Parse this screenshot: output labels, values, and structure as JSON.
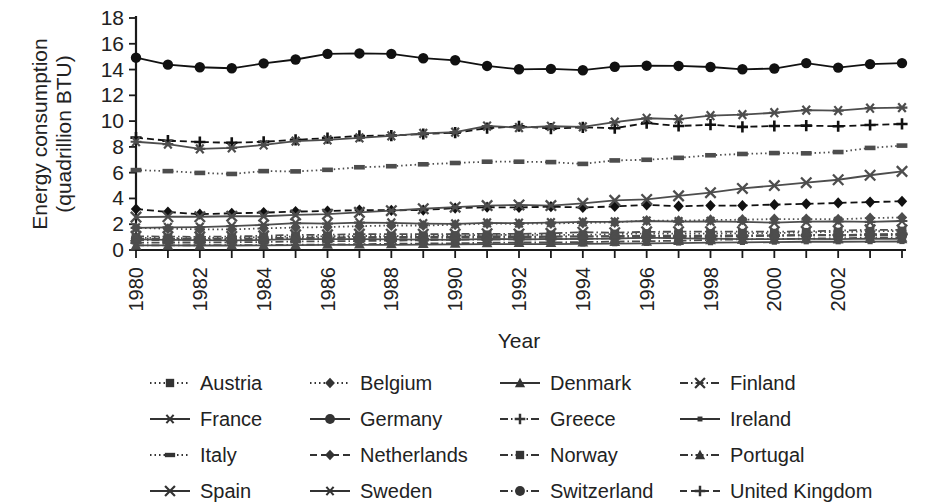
{
  "chart_data": {
    "type": "line",
    "title": "",
    "xlabel": "Year",
    "ylabel": "Energy consumption (quadrillion BTU)",
    "ylabel_line1": "Energy consumption",
    "ylabel_line2": "(quadrillion BTU)",
    "grid": false,
    "legend_position": "bottom",
    "xlim": [
      1980,
      2004
    ],
    "ylim": [
      0,
      18
    ],
    "yticks": [
      0,
      2,
      4,
      6,
      8,
      10,
      12,
      14,
      16,
      18
    ],
    "ytick_labels": [
      "0",
      "2",
      "4",
      "6",
      "8",
      "10",
      "12",
      "14",
      "16",
      "18"
    ],
    "xticks": [
      1980,
      1981,
      1982,
      1983,
      1984,
      1985,
      1986,
      1987,
      1988,
      1989,
      1990,
      1991,
      1992,
      1993,
      1994,
      1995,
      1996,
      1997,
      1998,
      1999,
      2000,
      2001,
      2002,
      2003,
      2004
    ],
    "xtick_labels_shown": [
      "1980",
      "1982",
      "1984",
      "1986",
      "1988",
      "1990",
      "1992",
      "1994",
      "1996",
      "1998",
      "2000",
      "2002"
    ],
    "x": [
      1980,
      1981,
      1982,
      1983,
      1984,
      1985,
      1986,
      1987,
      1988,
      1989,
      1990,
      1991,
      1992,
      1993,
      1994,
      1995,
      1996,
      1997,
      1998,
      1999,
      2000,
      2001,
      2002,
      2003,
      2004
    ],
    "series": [
      {
        "name": "Austria",
        "marker": "square",
        "dash": "dotted",
        "color": "#4d4d4d",
        "values": [
          0.95,
          0.93,
          0.92,
          0.95,
          1.0,
          1.05,
          1.06,
          1.09,
          1.08,
          1.1,
          1.12,
          1.18,
          1.16,
          1.17,
          1.17,
          1.24,
          1.28,
          1.27,
          1.28,
          1.3,
          1.31,
          1.37,
          1.39,
          1.45,
          1.47
        ]
      },
      {
        "name": "Belgium",
        "marker": "diamond",
        "dash": "dotted",
        "color": "#4d4d4d",
        "values": [
          1.72,
          1.65,
          1.6,
          1.6,
          1.68,
          1.74,
          1.78,
          1.85,
          1.9,
          1.9,
          1.96,
          2.05,
          2.03,
          2.06,
          2.1,
          2.15,
          2.29,
          2.27,
          2.33,
          2.35,
          2.4,
          2.4,
          2.38,
          2.48,
          2.52
        ]
      },
      {
        "name": "Denmark",
        "marker": "triangle",
        "dash": "solid",
        "color": "#4d4d4d",
        "values": [
          0.82,
          0.78,
          0.76,
          0.75,
          0.78,
          0.84,
          0.84,
          0.85,
          0.82,
          0.8,
          0.78,
          0.86,
          0.83,
          0.84,
          0.86,
          0.88,
          0.96,
          0.9,
          0.88,
          0.85,
          0.84,
          0.86,
          0.85,
          0.89,
          0.87
        ]
      },
      {
        "name": "Finland",
        "marker": "x",
        "dash": "dashdot",
        "color": "#4d4d4d",
        "values": [
          1.06,
          1.04,
          1.02,
          1.05,
          1.1,
          1.18,
          1.18,
          1.24,
          1.23,
          1.23,
          1.24,
          1.26,
          1.25,
          1.29,
          1.38,
          1.34,
          1.41,
          1.42,
          1.42,
          1.42,
          1.42,
          1.45,
          1.5,
          1.57,
          1.56
        ]
      },
      {
        "name": "France",
        "marker": "asterisk",
        "dash": "solid",
        "color": "#4d4d4d",
        "values": [
          8.4,
          8.22,
          7.85,
          7.92,
          8.15,
          8.45,
          8.55,
          8.7,
          8.85,
          9.05,
          9.15,
          9.62,
          9.5,
          9.6,
          9.55,
          9.92,
          10.22,
          10.15,
          10.42,
          10.5,
          10.65,
          10.85,
          10.82,
          11.0,
          11.05
        ]
      },
      {
        "name": "Germany",
        "marker": "circle",
        "dash": "solid",
        "color": "#111111",
        "values": [
          14.92,
          14.38,
          14.18,
          14.1,
          14.48,
          14.78,
          15.22,
          15.25,
          15.22,
          14.88,
          14.72,
          14.28,
          14.02,
          14.05,
          13.95,
          14.22,
          14.3,
          14.28,
          14.2,
          14.02,
          14.08,
          14.5,
          14.15,
          14.42,
          14.5
        ]
      },
      {
        "name": "Greece",
        "marker": "plus",
        "dash": "dashdot",
        "color": "#4d4d4d",
        "values": [
          0.56,
          0.58,
          0.58,
          0.6,
          0.62,
          0.66,
          0.68,
          0.7,
          0.73,
          0.76,
          0.8,
          0.8,
          0.83,
          0.84,
          0.87,
          0.9,
          0.95,
          0.98,
          1.04,
          1.06,
          1.12,
          1.14,
          1.16,
          1.22,
          1.25
        ]
      },
      {
        "name": "Ireland",
        "marker": "small-square",
        "dash": "solid",
        "color": "#4d4d4d",
        "values": [
          0.36,
          0.36,
          0.35,
          0.35,
          0.36,
          0.38,
          0.39,
          0.39,
          0.4,
          0.42,
          0.43,
          0.45,
          0.45,
          0.46,
          0.47,
          0.49,
          0.52,
          0.54,
          0.57,
          0.59,
          0.61,
          0.64,
          0.64,
          0.65,
          0.66
        ]
      },
      {
        "name": "Italy",
        "marker": "dash-rect",
        "dash": "dotted",
        "color": "#4d4d4d",
        "values": [
          6.2,
          6.12,
          5.98,
          5.9,
          6.12,
          6.1,
          6.22,
          6.42,
          6.5,
          6.65,
          6.75,
          6.85,
          6.85,
          6.82,
          6.68,
          6.95,
          7.0,
          7.15,
          7.35,
          7.45,
          7.52,
          7.5,
          7.6,
          7.92,
          8.1
        ]
      },
      {
        "name": "Netherlands",
        "marker": "diamond",
        "dash": "dashed",
        "color": "#111111",
        "values": [
          3.18,
          2.95,
          2.78,
          2.85,
          2.9,
          2.98,
          3.02,
          3.1,
          3.08,
          3.1,
          3.25,
          3.32,
          3.3,
          3.36,
          3.3,
          3.38,
          3.5,
          3.4,
          3.45,
          3.45,
          3.52,
          3.58,
          3.65,
          3.72,
          3.78
        ]
      },
      {
        "name": "Norway",
        "marker": "square",
        "dash": "dashdot",
        "color": "#4d4d4d",
        "values": [
          0.77,
          0.78,
          0.78,
          0.8,
          0.85,
          0.92,
          0.92,
          0.95,
          0.95,
          0.95,
          0.95,
          0.98,
          0.98,
          1.02,
          1.05,
          1.08,
          1.12,
          1.12,
          1.12,
          1.15,
          1.12,
          1.17,
          1.15,
          1.18,
          1.22
        ]
      },
      {
        "name": "Portugal",
        "marker": "triangle",
        "dash": "dashdot",
        "color": "#4d4d4d",
        "values": [
          0.36,
          0.36,
          0.37,
          0.38,
          0.38,
          0.4,
          0.43,
          0.45,
          0.48,
          0.5,
          0.52,
          0.56,
          0.58,
          0.58,
          0.62,
          0.65,
          0.68,
          0.72,
          0.78,
          0.83,
          0.85,
          0.88,
          0.92,
          0.94,
          0.98
        ]
      },
      {
        "name": "Spain",
        "marker": "x",
        "dash": "solid",
        "color": "#4d4d4d",
        "values": [
          2.55,
          2.58,
          2.58,
          2.62,
          2.62,
          2.72,
          2.78,
          2.92,
          3.05,
          3.2,
          3.32,
          3.45,
          3.5,
          3.45,
          3.62,
          3.85,
          3.92,
          4.2,
          4.45,
          4.78,
          5.0,
          5.22,
          5.45,
          5.8,
          6.1
        ]
      },
      {
        "name": "Sweden",
        "marker": "asterisk",
        "dash": "solid",
        "color": "#4d4d4d",
        "values": [
          1.72,
          1.75,
          1.78,
          1.85,
          1.95,
          2.08,
          2.05,
          2.12,
          2.1,
          2.05,
          2.02,
          2.1,
          2.08,
          2.12,
          2.18,
          2.18,
          2.25,
          2.2,
          2.22,
          2.18,
          2.12,
          2.2,
          2.22,
          2.18,
          2.25
        ]
      },
      {
        "name": "Switzerland",
        "marker": "circle",
        "dash": "dashdot",
        "color": "#4d4d4d",
        "values": [
          0.88,
          0.86,
          0.86,
          0.88,
          0.92,
          0.96,
          0.98,
          1.0,
          1.02,
          1.02,
          1.05,
          1.08,
          1.06,
          1.06,
          1.05,
          1.06,
          1.08,
          1.08,
          1.1,
          1.1,
          1.12,
          1.14,
          1.12,
          1.14,
          1.15
        ]
      },
      {
        "name": "United Kingdom",
        "marker": "plus",
        "dash": "dashed",
        "color": "#111111",
        "values": [
          8.72,
          8.48,
          8.38,
          8.32,
          8.4,
          8.55,
          8.68,
          8.85,
          8.88,
          9.0,
          9.1,
          9.45,
          9.6,
          9.42,
          9.52,
          9.45,
          9.85,
          9.62,
          9.72,
          9.55,
          9.62,
          9.65,
          9.6,
          9.7,
          9.78
        ]
      }
    ],
    "legend": [
      {
        "label": "Austria",
        "marker": "square",
        "dash": "dotted"
      },
      {
        "label": "Belgium",
        "marker": "diamond",
        "dash": "dotted"
      },
      {
        "label": "Denmark",
        "marker": "triangle",
        "dash": "solid"
      },
      {
        "label": "Finland",
        "marker": "x",
        "dash": "dashdot"
      },
      {
        "label": "France",
        "marker": "asterisk",
        "dash": "solid"
      },
      {
        "label": "Germany",
        "marker": "circle",
        "dash": "solid"
      },
      {
        "label": "Greece",
        "marker": "plus",
        "dash": "dashdot"
      },
      {
        "label": "Ireland",
        "marker": "small-square",
        "dash": "solid"
      },
      {
        "label": "Italy",
        "marker": "dash-rect",
        "dash": "dotted"
      },
      {
        "label": "Netherlands",
        "marker": "diamond",
        "dash": "dashed"
      },
      {
        "label": "Norway",
        "marker": "square",
        "dash": "dashdot"
      },
      {
        "label": "Portugal",
        "marker": "triangle",
        "dash": "dashdot"
      },
      {
        "label": "Spain",
        "marker": "x",
        "dash": "solid"
      },
      {
        "label": "Sweden",
        "marker": "asterisk",
        "dash": "solid"
      },
      {
        "label": "Switzerland",
        "marker": "circle",
        "dash": "dashdot"
      },
      {
        "label": "United Kingdom",
        "marker": "plus",
        "dash": "dashed"
      }
    ]
  }
}
